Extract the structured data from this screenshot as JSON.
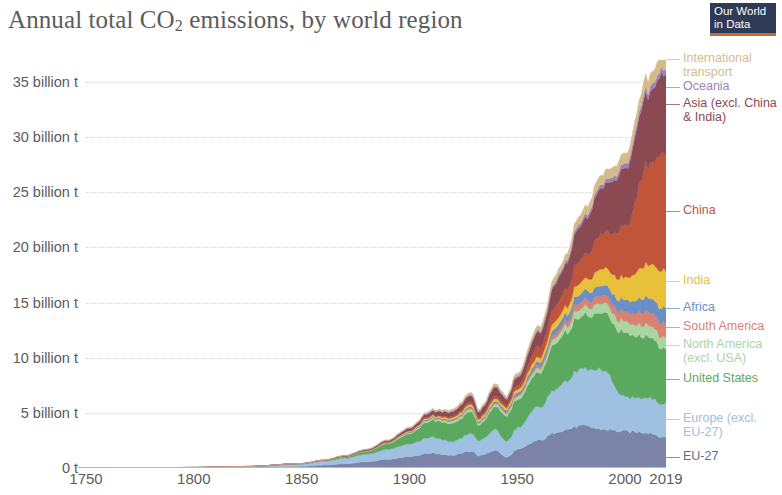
{
  "logo": {
    "line1": "Our World",
    "line2": "in Data",
    "bg": "#2f3a56",
    "accent": "#d1692e"
  },
  "chart_data": {
    "type": "area",
    "stacked": true,
    "xlabel": "",
    "ylabel": "",
    "grid": true,
    "legend_position": "right",
    "xlim": [
      1750,
      2019
    ],
    "ylim": [
      0,
      37
    ],
    "y_unit": "billion t",
    "x_ticks": [
      1750,
      1800,
      1850,
      1900,
      1950,
      2000,
      2019
    ],
    "x_tick_labels": [
      "1750",
      "1800",
      "1850",
      "1900",
      "1950",
      "2000",
      "2019"
    ],
    "y_ticks": [
      0,
      5,
      10,
      15,
      20,
      25,
      30,
      35
    ],
    "y_tick_labels": [
      "0 t",
      "5 billion t",
      "10 billion t",
      "15 billion t",
      "20 billion t",
      "25 billion t",
      "30 billion t",
      "35 billion t"
    ],
    "x": [
      1750,
      1775,
      1800,
      1825,
      1850,
      1860,
      1870,
      1880,
      1890,
      1900,
      1910,
      1920,
      1929,
      1932,
      1940,
      1945,
      1950,
      1960,
      1970,
      1980,
      1990,
      2000,
      2010,
      2019
    ],
    "series": [
      {
        "name": "EU-27",
        "color": "#7b84a8",
        "values": [
          0.0,
          0.01,
          0.02,
          0.05,
          0.15,
          0.26,
          0.38,
          0.56,
          0.8,
          1.05,
          1.35,
          1.15,
          1.55,
          1.1,
          1.6,
          0.95,
          1.65,
          2.5,
          3.4,
          3.8,
          3.5,
          3.3,
          3.25,
          2.75
        ]
      },
      {
        "name": "Europe (excl. EU-27)",
        "color": "#9fc0e0",
        "values": [
          0.0,
          0.01,
          0.03,
          0.08,
          0.22,
          0.34,
          0.5,
          0.68,
          0.92,
          1.15,
          1.45,
          1.25,
          1.6,
          1.35,
          1.85,
          1.45,
          1.95,
          3.05,
          4.2,
          5.1,
          5.3,
          3.05,
          3.2,
          3.05
        ]
      },
      {
        "name": "United States",
        "color": "#5ba85f",
        "values": [
          0.0,
          0.0,
          0.0,
          0.01,
          0.03,
          0.07,
          0.13,
          0.25,
          0.5,
          0.9,
          1.5,
          1.65,
          2.0,
          1.4,
          2.1,
          2.3,
          2.6,
          3.1,
          4.4,
          4.75,
          5.1,
          5.85,
          5.6,
          5.0
        ]
      },
      {
        "name": "North America (excl. USA)",
        "color": "#a9d6a0",
        "values": [
          0.0,
          0.0,
          0.0,
          0.0,
          0.0,
          0.01,
          0.02,
          0.03,
          0.06,
          0.09,
          0.15,
          0.18,
          0.22,
          0.16,
          0.22,
          0.24,
          0.28,
          0.38,
          0.55,
          0.75,
          0.85,
          1.0,
          1.05,
          1.0
        ]
      },
      {
        "name": "South America",
        "color": "#d98272",
        "values": [
          0.0,
          0.0,
          0.0,
          0.0,
          0.0,
          0.0,
          0.01,
          0.01,
          0.02,
          0.03,
          0.05,
          0.07,
          0.1,
          0.08,
          0.1,
          0.12,
          0.15,
          0.25,
          0.4,
          0.6,
          0.7,
          0.9,
          1.2,
          1.25
        ]
      },
      {
        "name": "Africa",
        "color": "#6b8ec4",
        "values": [
          0.0,
          0.0,
          0.0,
          0.0,
          0.0,
          0.0,
          0.01,
          0.02,
          0.03,
          0.05,
          0.08,
          0.1,
          0.14,
          0.12,
          0.16,
          0.18,
          0.22,
          0.35,
          0.55,
          0.8,
          0.9,
          1.05,
          1.25,
          1.4
        ]
      },
      {
        "name": "India",
        "color": "#e8c03a",
        "values": [
          0.0,
          0.0,
          0.0,
          0.0,
          0.0,
          0.01,
          0.02,
          0.03,
          0.05,
          0.08,
          0.12,
          0.15,
          0.2,
          0.18,
          0.22,
          0.24,
          0.28,
          0.4,
          0.65,
          1.0,
          1.55,
          2.05,
          2.95,
          3.45
        ]
      },
      {
        "name": "China",
        "color": "#c0553a",
        "values": [
          0.0,
          0.0,
          0.0,
          0.0,
          0.0,
          0.0,
          0.0,
          0.01,
          0.02,
          0.04,
          0.08,
          0.12,
          0.2,
          0.16,
          0.25,
          0.22,
          0.35,
          0.95,
          1.4,
          2.1,
          3.2,
          4.6,
          8.8,
          10.7
        ]
      },
      {
        "name": "Asia (excl. China & India)",
        "color": "#8b4a52",
        "values": [
          0.0,
          0.0,
          0.0,
          0.0,
          0.01,
          0.02,
          0.04,
          0.07,
          0.12,
          0.2,
          0.32,
          0.42,
          0.6,
          0.5,
          0.8,
          0.55,
          0.75,
          1.3,
          2.2,
          3.1,
          4.3,
          5.2,
          6.4,
          7.1
        ]
      },
      {
        "name": "Oceania",
        "color": "#9d82b8",
        "values": [
          0.0,
          0.0,
          0.0,
          0.0,
          0.0,
          0.0,
          0.01,
          0.01,
          0.02,
          0.04,
          0.06,
          0.07,
          0.09,
          0.08,
          0.1,
          0.11,
          0.13,
          0.18,
          0.25,
          0.3,
          0.33,
          0.42,
          0.48,
          0.5
        ]
      },
      {
        "name": "International transport",
        "color": "#d6bb8a",
        "values": [
          0.0,
          0.0,
          0.0,
          0.0,
          0.0,
          0.01,
          0.02,
          0.03,
          0.05,
          0.08,
          0.12,
          0.15,
          0.2,
          0.16,
          0.22,
          0.2,
          0.26,
          0.38,
          0.55,
          0.72,
          0.85,
          0.95,
          1.1,
          1.25
        ]
      }
    ],
    "totals_note": "Stacked total peaks near 36 billion t in 2019"
  },
  "legend": [
    {
      "label": "International\ntransport",
      "color": "#d6bb8a",
      "y": 0
    },
    {
      "label": "Oceania",
      "color": "#9d82b8",
      "y": 28
    },
    {
      "label": "Asia (excl. China\n& India)",
      "color": "#8b4a52",
      "y": 45
    },
    {
      "label": "China",
      "color": "#c0553a",
      "y": 152
    },
    {
      "label": "India",
      "color": "#e8c03a",
      "y": 222
    },
    {
      "label": "Africa",
      "color": "#6b8ec4",
      "y": 249
    },
    {
      "label": "South America",
      "color": "#d98272",
      "y": 268
    },
    {
      "label": "North America\n(excl. USA)",
      "color": "#a9d6a0",
      "y": 286
    },
    {
      "label": "United States",
      "color": "#5ba85f",
      "y": 320
    },
    {
      "label": "Europe (excl.\nEU-27)",
      "color": "#9fc0e0",
      "y": 360
    },
    {
      "label": "EU-27",
      "color": "#5f6b8d",
      "y": 398
    }
  ]
}
